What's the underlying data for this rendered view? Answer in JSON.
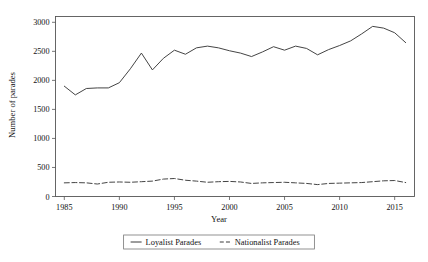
{
  "chart_data": {
    "type": "line",
    "title": "",
    "xlabel": "Year",
    "ylabel": "Number of parades",
    "xlim": [
      1984.2,
      2016.8
    ],
    "ylim": [
      0,
      3100
    ],
    "grid": false,
    "legend_position": "bottom-center",
    "xticks": [
      1985,
      1990,
      1995,
      2000,
      2005,
      2010,
      2015
    ],
    "yticks": [
      0,
      500,
      1000,
      1500,
      2000,
      2500,
      3000
    ],
    "xtick_labels": [
      "1985",
      "1990",
      "1995",
      "2000",
      "2005",
      "2010",
      "2015"
    ],
    "ytick_labels": [
      "0",
      "500",
      "1000",
      "1500",
      "2000",
      "2500",
      "3000"
    ],
    "x": [
      1985,
      1986,
      1987,
      1988,
      1989,
      1990,
      1991,
      1992,
      1993,
      1994,
      1995,
      1996,
      1997,
      1998,
      1999,
      2000,
      2001,
      2002,
      2003,
      2004,
      2005,
      2006,
      2007,
      2008,
      2009,
      2010,
      2011,
      2012,
      2013,
      2014,
      2015,
      2016
    ],
    "series": [
      {
        "name": "Loyalist Parades",
        "style": "solid",
        "color": "#3a3a3a",
        "values": [
          1900,
          1750,
          1860,
          1870,
          1870,
          1960,
          2200,
          2470,
          2180,
          2380,
          2520,
          2450,
          2560,
          2590,
          2560,
          2510,
          2470,
          2410,
          2490,
          2580,
          2520,
          2590,
          2550,
          2440,
          2530,
          2600,
          2680,
          2800,
          2930,
          2900,
          2820,
          2650
        ]
      },
      {
        "name": "Nationalist Parades",
        "style": "dashed",
        "color": "#3a3a3a",
        "values": [
          235,
          240,
          235,
          215,
          245,
          250,
          245,
          255,
          265,
          300,
          310,
          280,
          265,
          245,
          255,
          260,
          250,
          225,
          235,
          240,
          245,
          235,
          225,
          205,
          225,
          230,
          235,
          240,
          255,
          270,
          275,
          240
        ]
      }
    ]
  },
  "legend": {
    "items": [
      {
        "label": "Loyalist Parades",
        "style": "solid"
      },
      {
        "label": "Nationalist Parades",
        "style": "dashed"
      }
    ]
  }
}
